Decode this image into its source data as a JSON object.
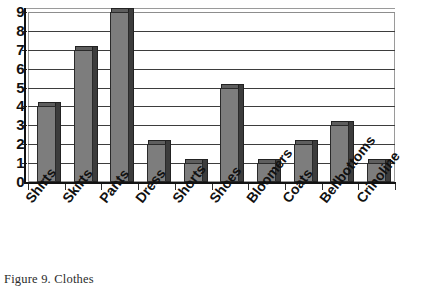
{
  "caption": "Figure 9. Clothes",
  "chart_data": {
    "type": "bar",
    "title": "",
    "xlabel": "",
    "ylabel": "",
    "categories": [
      "Shirts",
      "Skirts",
      "Pants",
      "Dress",
      "Shorts",
      "Shoes",
      "Bloomers",
      "Coats",
      "Bellbottoms",
      "Crinoline"
    ],
    "values": [
      4,
      7,
      9,
      2,
      1,
      5,
      1,
      2,
      3,
      1
    ],
    "ylim": [
      0,
      9
    ],
    "yticks": [
      "0",
      "1",
      "2",
      "3",
      "4",
      "5",
      "6",
      "7",
      "8",
      "9"
    ],
    "grid": true,
    "legend": false,
    "style": "3d-column",
    "colors": {
      "bar_face": "#7d7d7d",
      "bar_side": "#3c3c3c",
      "bar_top": "#5e5e5e",
      "gridline": "#3d3d3d",
      "axis": "#121212",
      "plot_background": "#ffffff"
    }
  }
}
